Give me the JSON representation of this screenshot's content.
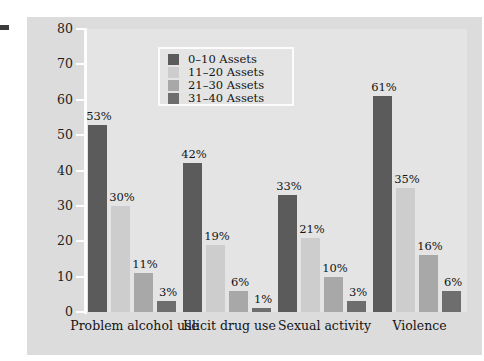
{
  "chart_data": {
    "type": "bar",
    "title": "",
    "subtitle": "",
    "xlabel": "",
    "ylabel": "",
    "ylim": [
      0,
      80
    ],
    "yticks": [
      0,
      10,
      20,
      30,
      40,
      50,
      60,
      70,
      80
    ],
    "ytick_labels": [
      "0",
      "10",
      "20",
      "30",
      "40",
      "50",
      "60",
      "70",
      "80"
    ],
    "grid": false,
    "legend_position": "top-center",
    "categories": [
      "Problem alcohol use",
      "Illicit drug use",
      "Sexual activity",
      "Violence"
    ],
    "series": [
      {
        "name": "0–10 Assets",
        "color": "#5b5b5b",
        "values": [
          53,
          42,
          33,
          61
        ],
        "labels": [
          "53%",
          "42%",
          "33%",
          "61%"
        ]
      },
      {
        "name": "11–20 Assets",
        "color": "#cdcdcd",
        "values": [
          30,
          19,
          21,
          35
        ],
        "labels": [
          "30%",
          "19%",
          "21%",
          "35%"
        ]
      },
      {
        "name": "21–30 Assets",
        "color": "#a8a8a8",
        "values": [
          11,
          6,
          10,
          16
        ],
        "labels": [
          "11%",
          "6%",
          "10%",
          "16%"
        ]
      },
      {
        "name": "31–40 Assets",
        "color": "#6e6e6e",
        "values": [
          3,
          1,
          3,
          6
        ],
        "labels": [
          "3%",
          "1%",
          "3%",
          "6%"
        ]
      }
    ]
  },
  "legend": {
    "entries": [
      {
        "label": "0–10 Assets",
        "color": "#5b5b5b"
      },
      {
        "label": "11–20 Assets",
        "color": "#cdcdcd"
      },
      {
        "label": "21–30 Assets",
        "color": "#a8a8a8"
      },
      {
        "label": "31–40 Assets",
        "color": "#6e6e6e"
      }
    ]
  },
  "colors": {
    "page_background": "#ffffff",
    "card_background": "#dcdcdc",
    "plot_background": "#e4e4e4",
    "axis_line": "#fdfdfd",
    "text": "#141414"
  }
}
